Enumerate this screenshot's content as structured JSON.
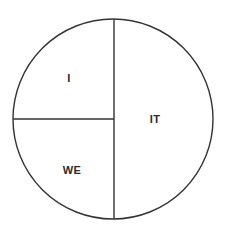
{
  "diagram": {
    "type": "divided-circle",
    "title": "",
    "background_color": "#ffffff",
    "stroke_color": "#333333",
    "stroke_width": 1.4,
    "text_color": "#2b2b2b",
    "circle": {
      "center_x": 113,
      "center_y": 119,
      "radius": 100
    },
    "dividers": [
      {
        "name": "vertical-divider",
        "orientation": "vertical",
        "x": 114,
        "y1": 19,
        "y2": 219
      },
      {
        "name": "horizontal-divider",
        "orientation": "horizontal",
        "y": 119,
        "x1": 14,
        "x2": 114
      }
    ],
    "regions": [
      {
        "id": "upper-left",
        "label": "I",
        "position": "upper-left-quadrant"
      },
      {
        "id": "right-half",
        "label": "IT",
        "position": "right-half"
      },
      {
        "id": "lower-left",
        "label": "WE",
        "position": "lower-left-quadrant"
      }
    ]
  }
}
